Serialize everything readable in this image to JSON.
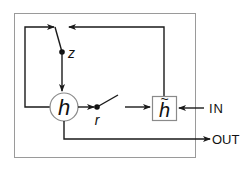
{
  "diagram": {
    "title": "",
    "nodes": {
      "h": {
        "label": "h",
        "shape": "circle"
      },
      "h_tilde": {
        "label": "h",
        "accent": "~",
        "shape": "box"
      }
    },
    "switches": {
      "z": {
        "label": "z"
      },
      "r": {
        "label": "r"
      }
    },
    "ports": {
      "input": {
        "label": "IN"
      },
      "output": {
        "label": "OUT"
      }
    },
    "edges": [
      {
        "from": "h",
        "to": "r",
        "type": "arrow"
      },
      {
        "from": "r",
        "to": "h_tilde",
        "type": "arrow"
      },
      {
        "from": "IN",
        "to": "h_tilde",
        "type": "arrow"
      },
      {
        "from": "h_tilde",
        "to": "z",
        "type": "arrow"
      },
      {
        "from": "h",
        "to": "z",
        "type": "arrow",
        "note": "feedback loop via left side"
      },
      {
        "from": "z",
        "to": "h",
        "type": "arrow"
      },
      {
        "from": "h",
        "to": "OUT",
        "type": "arrow"
      }
    ],
    "colors": {
      "line": "#1a1a1a",
      "frame": "#9a9a9a",
      "node_border": "#8a8a8a"
    }
  }
}
